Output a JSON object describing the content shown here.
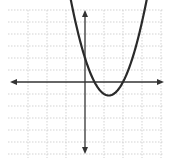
{
  "chart_data": {
    "type": "line",
    "title": "",
    "xlabel": "",
    "ylabel": "",
    "grid": true,
    "legend": null,
    "function": "y = 2x^2 - 5x + 2",
    "xlim": [
      -4.5,
      4.5
    ],
    "ylim": [
      -6.5,
      6.5
    ],
    "x": [
      -0.75,
      -0.5,
      0,
      0.5,
      1,
      1.25,
      1.5,
      2,
      2.5,
      3,
      3.3
    ],
    "series": [
      {
        "name": "parabola",
        "values": [
          6.875,
          5.0,
          2.0,
          0.0,
          -1.0,
          -1.125,
          -1.0,
          0.0,
          2.0,
          5.0,
          7.28
        ]
      }
    ],
    "annotations": {
      "roots": [
        0.5,
        2
      ],
      "y_intercept": 2,
      "vertex": [
        1.25,
        -1.125
      ]
    }
  },
  "colors": {
    "grid": "#c8c8c8",
    "axis": "#333333",
    "curve": "#2a2a2a"
  }
}
